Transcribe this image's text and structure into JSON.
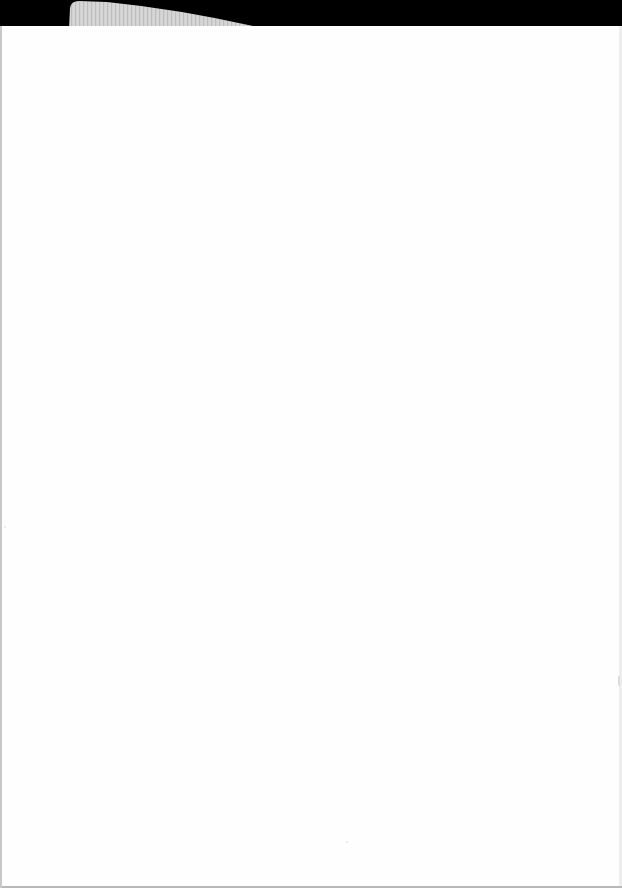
{
  "document": {
    "type": "scanned-blank-page",
    "content_text": "",
    "colors": {
      "background": "#000000",
      "page": "#fefefe",
      "tab": "#d9d9d9",
      "edge": "#c8c8c8"
    }
  }
}
